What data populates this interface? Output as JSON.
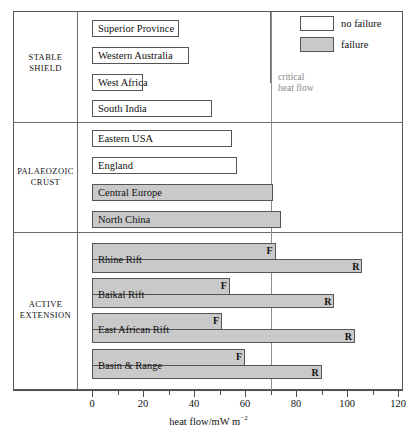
{
  "chart_data": {
    "type": "bar",
    "title": "",
    "xlabel": "heat flow/mW m",
    "xlabel_sup": "−2",
    "ylabel": "",
    "xlim": [
      0,
      120
    ],
    "xticks": [
      0,
      20,
      40,
      60,
      80,
      100,
      120
    ],
    "xticklabels": [
      "0",
      "20",
      "40",
      "60",
      "80",
      "100",
      "120"
    ],
    "minor_tick_step": 10,
    "grid": false,
    "orientation": "horizontal",
    "legend": {
      "position": "top-right",
      "entries": [
        {
          "label": "no failure",
          "swatch": "no-failure",
          "color": "#ffffff"
        },
        {
          "label": "failure",
          "swatch": "failure",
          "color": "#c9c9c9"
        }
      ]
    },
    "annotations": [
      {
        "name": "critical-heat-flow",
        "text_line1": "critical",
        "text_line2": "heat flow",
        "value": 70,
        "color": "#8a8a8a"
      }
    ],
    "groups": [
      {
        "name": "STABLE SHIELD",
        "label_line1": "STABLE",
        "label_line2": "SHIELD",
        "bars": [
          {
            "label": "Superior Province",
            "value": 34,
            "fill": "no-failure"
          },
          {
            "label": "Western Australia",
            "value": 38,
            "fill": "no-failure"
          },
          {
            "label": "West Africa",
            "value": 20,
            "fill": "no-failure"
          },
          {
            "label": "South India",
            "value": 47,
            "fill": "no-failure"
          }
        ]
      },
      {
        "name": "PALAEOZOIC CRUST",
        "label_line1": "PALAEOZOIC",
        "label_line2": "CRUST",
        "bars": [
          {
            "label": "Eastern USA",
            "value": 55,
            "fill": "no-failure"
          },
          {
            "label": "England",
            "value": 57,
            "fill": "no-failure"
          },
          {
            "label": "Central Europe",
            "value": 71,
            "fill": "failure"
          },
          {
            "label": "North China",
            "value": 74,
            "fill": "failure"
          }
        ]
      },
      {
        "name": "ACTIVE EXTENSION",
        "label_line1": "ACTIVE",
        "label_line2": "EXTENSION",
        "bars": [
          {
            "label": "Rhine Rift",
            "value_f": 72,
            "value_r": 106,
            "fill": "failure",
            "marker_f": "F",
            "marker_r": "R"
          },
          {
            "label": "Baikal  Rift",
            "value_f": 54,
            "value_r": 95,
            "fill": "failure",
            "marker_f": "F",
            "marker_r": "R"
          },
          {
            "label": "East African Rift",
            "value_f": 51,
            "value_r": 103,
            "fill": "failure",
            "marker_f": "F",
            "marker_r": "R"
          },
          {
            "label": "Basin & Range",
            "value_f": 60,
            "value_r": 90,
            "fill": "failure",
            "marker_f": "F",
            "marker_r": "R"
          }
        ]
      }
    ]
  }
}
